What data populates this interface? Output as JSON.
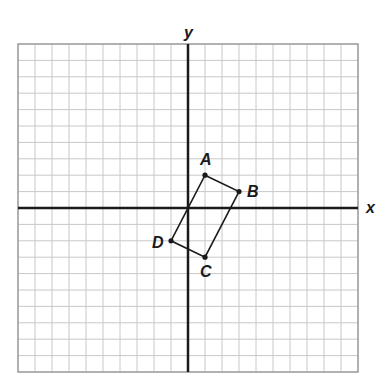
{
  "diagram": {
    "type": "coordinate-plane",
    "grid": {
      "columns": 20,
      "rows": 20,
      "x_range": [
        -10,
        10
      ],
      "y_range": [
        -10,
        10
      ],
      "line_color": "#c8c8c8",
      "border_color": "#a0a0a0"
    },
    "axes": {
      "x_label": "x",
      "y_label": "y",
      "color": "#1a1a1a"
    },
    "shape": {
      "name": "parallelogram ABCD",
      "stroke": "#1a1a1a",
      "vertices": [
        {
          "label": "A",
          "x": 1,
          "y": 2
        },
        {
          "label": "B",
          "x": 3,
          "y": 1
        },
        {
          "label": "C",
          "x": 1,
          "y": -3
        },
        {
          "label": "D",
          "x": -1,
          "y": -2
        }
      ]
    }
  }
}
